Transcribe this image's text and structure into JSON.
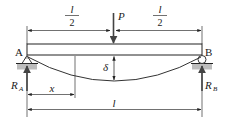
{
  "diagram": {
    "labels": {
      "support_left": "A",
      "support_right": "B",
      "load": "P",
      "half_span_left_num": "l",
      "half_span_left_den": "2",
      "half_span_right_num": "l",
      "half_span_right_den": "2",
      "deflection": "δ",
      "reaction_left_main": "R",
      "reaction_left_sub": "A",
      "reaction_right_main": "R",
      "reaction_right_sub": "B",
      "position": "x",
      "span": "l"
    },
    "colors": {
      "line": "#222222",
      "ground": "#b8b8b8",
      "background": "#ffffff"
    }
  }
}
